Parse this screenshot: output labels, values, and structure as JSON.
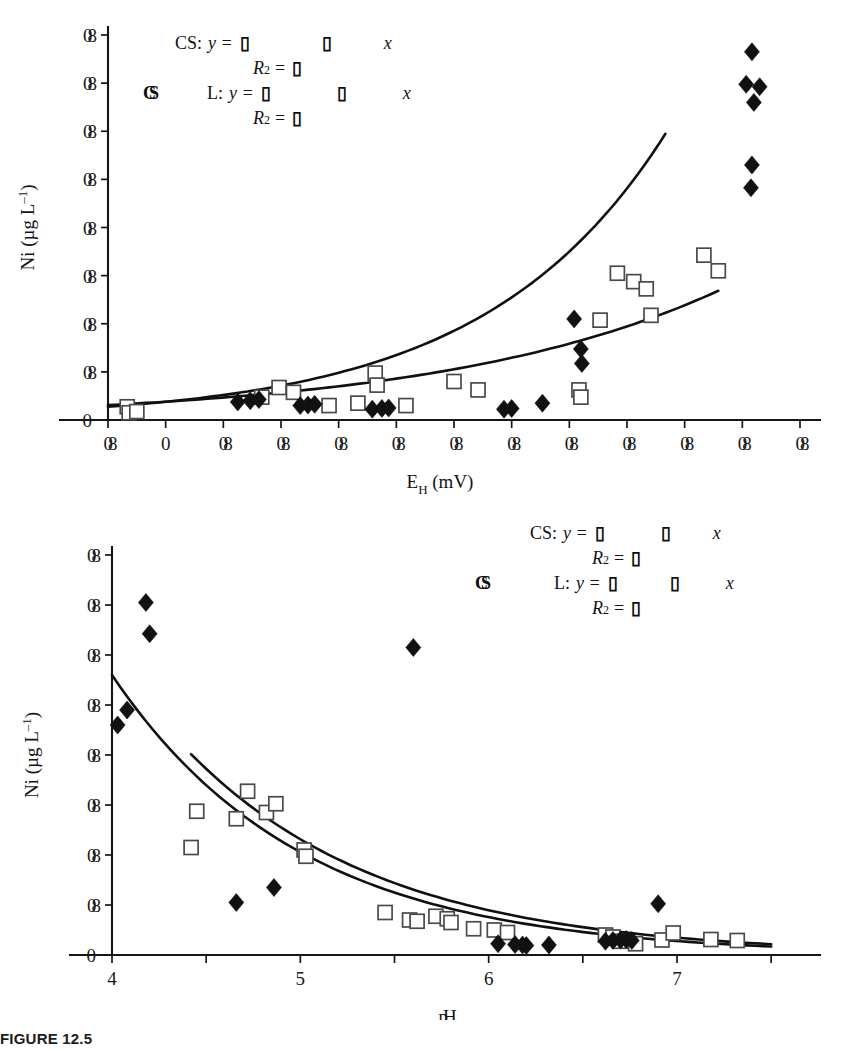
{
  "caption": {
    "text": "FIGURE 12.5"
  },
  "chart_data": [
    {
      "id": "eh-panel",
      "type": "scatter",
      "title": "",
      "xlabel": "E_H (mV)",
      "xlabel_parts": {
        "main": "E",
        "sub": "H",
        "unit": "(mV)"
      },
      "ylabel": "Ni (µg L⁻¹)",
      "ylabel_parts": {
        "main": "Ni",
        "unit": "(µg L",
        "exp": "–1",
        "close": ")"
      },
      "xlim": [
        -60,
        660
      ],
      "ylim": [
        0,
        16
      ],
      "xticks": [
        -60,
        0,
        60,
        120,
        180,
        240,
        300,
        360,
        420,
        480,
        540,
        600,
        660
      ],
      "xtick_labels": [
        "▯",
        "0",
        "▯",
        "▯",
        "▯",
        "▯",
        "▯",
        "▯",
        "▯",
        "▯",
        "▯",
        "▯",
        "▯"
      ],
      "xtick_labels_legible": [
        false,
        true,
        false,
        false,
        false,
        false,
        false,
        false,
        false,
        false,
        false,
        false,
        false
      ],
      "yticks": [
        0,
        2,
        4,
        6,
        8,
        10,
        12,
        14,
        16
      ],
      "ytick_labels": [
        "0",
        "▯",
        "▯",
        "▯",
        "▯",
        "▯",
        "▯",
        "▯",
        "▯"
      ],
      "ytick_labels_legible": [
        true,
        false,
        false,
        false,
        false,
        false,
        false,
        false,
        false
      ],
      "grid": false,
      "legend_position": "top-left",
      "series": [
        {
          "name": "L",
          "marker": "open-square",
          "points": [
            [
              -40,
              0.55
            ],
            [
              -38,
              0.3
            ],
            [
              -30,
              0.35
            ],
            [
              100,
              0.95
            ],
            [
              118,
              1.35
            ],
            [
              133,
              1.15
            ],
            [
              170,
              0.6
            ],
            [
              200,
              0.7
            ],
            [
              218,
              1.95
            ],
            [
              220,
              1.45
            ],
            [
              250,
              0.6
            ],
            [
              300,
              1.6
            ],
            [
              325,
              1.25
            ],
            [
              430,
              1.25
            ],
            [
              432,
              0.95
            ],
            [
              452,
              4.15
            ],
            [
              470,
              6.1
            ],
            [
              487,
              5.75
            ],
            [
              500,
              5.45
            ],
            [
              505,
              4.35
            ],
            [
              560,
              6.85
            ],
            [
              575,
              6.2
            ]
          ]
        },
        {
          "name": "CS",
          "marker": "filled-diamond",
          "points": [
            [
              75,
              0.75
            ],
            [
              88,
              0.8
            ],
            [
              97,
              0.85
            ],
            [
              140,
              0.6
            ],
            [
              148,
              0.62
            ],
            [
              155,
              0.65
            ],
            [
              215,
              0.45
            ],
            [
              225,
              0.48
            ],
            [
              232,
              0.5
            ],
            [
              352,
              0.45
            ],
            [
              360,
              0.48
            ],
            [
              392,
              0.7
            ],
            [
              425,
              4.2
            ],
            [
              432,
              2.95
            ],
            [
              433,
              2.35
            ],
            [
              610,
              15.3
            ],
            [
              604,
              13.95
            ],
            [
              618,
              13.85
            ],
            [
              612,
              13.2
            ],
            [
              610,
              10.6
            ],
            [
              609,
              9.65
            ]
          ]
        }
      ],
      "curves": [
        {
          "name": "CS-exponential",
          "kind": "exponential-rising"
        },
        {
          "name": "L-exponential",
          "kind": "exponential-rising-shallow"
        }
      ],
      "legend": {
        "cs_label": "CS:",
        "l_label": "L:",
        "cs_marker": "◆",
        "l_marker": "□",
        "cs_eq_prefix": "y =",
        "cs_eq_coef": "▯",
        "cs_eq_mid": "▯",
        "cs_eq_var": "x",
        "cs_r2_label": "R",
        "cs_r2_sup": "2",
        "cs_r2_eq": "=",
        "cs_r2_value": "▯",
        "l_eq_prefix": "y =",
        "l_eq_coef": "▯",
        "l_eq_mid": "▯",
        "l_eq_var": "x",
        "l_r2_label": "R",
        "l_r2_sup": "2",
        "l_r2_eq": "=",
        "l_r2_value": "▯",
        "series_tag_cs": "CS"
      }
    },
    {
      "id": "ph-panel",
      "type": "scatter",
      "title": "",
      "xlabel": "pH",
      "xlabel_parts": {
        "main": "pH"
      },
      "ylabel": "Ni (µg L⁻¹)",
      "ylabel_parts": {
        "main": "Ni",
        "unit": "(µg L",
        "exp": "–1",
        "close": ")"
      },
      "xlim": [
        4,
        7.6
      ],
      "ylim": [
        0,
        16
      ],
      "xticks": [
        4,
        4.5,
        5,
        5.5,
        6,
        6.5,
        7,
        7.5
      ],
      "xtick_labels": [
        "4",
        "",
        "5",
        "",
        "6",
        "",
        "7",
        ""
      ],
      "xtick_labels_legible": [
        true,
        true,
        true,
        true,
        true,
        true,
        true,
        true
      ],
      "yticks": [
        0,
        2,
        4,
        6,
        8,
        10,
        12,
        14,
        16
      ],
      "ytick_labels": [
        "0",
        "▯",
        "▯",
        "▯",
        "▯",
        "▯",
        "▯",
        "▯",
        "▯"
      ],
      "ytick_labels_legible": [
        true,
        false,
        false,
        false,
        false,
        false,
        false,
        false,
        false
      ],
      "grid": false,
      "legend_position": "top-right",
      "series": [
        {
          "name": "L",
          "marker": "open-square",
          "points": [
            [
              4.45,
              5.75
            ],
            [
              4.42,
              4.3
            ],
            [
              4.72,
              6.55
            ],
            [
              4.66,
              5.45
            ],
            [
              4.82,
              5.7
            ],
            [
              4.87,
              6.05
            ],
            [
              5.02,
              4.2
            ],
            [
              5.03,
              3.95
            ],
            [
              5.45,
              1.7
            ],
            [
              5.58,
              1.4
            ],
            [
              5.62,
              1.35
            ],
            [
              5.72,
              1.55
            ],
            [
              5.78,
              1.45
            ],
            [
              5.8,
              1.3
            ],
            [
              5.92,
              1.05
            ],
            [
              6.03,
              1.0
            ],
            [
              6.1,
              0.9
            ],
            [
              6.62,
              0.8
            ],
            [
              6.66,
              0.72
            ],
            [
              6.7,
              0.55
            ],
            [
              6.78,
              0.45
            ],
            [
              6.92,
              0.6
            ],
            [
              6.98,
              0.88
            ],
            [
              7.18,
              0.62
            ],
            [
              7.32,
              0.58
            ]
          ]
        },
        {
          "name": "CS",
          "marker": "filled-diamond",
          "points": [
            [
              4.18,
              14.1
            ],
            [
              4.2,
              12.85
            ],
            [
              4.08,
              9.8
            ],
            [
              4.03,
              9.2
            ],
            [
              5.6,
              12.3
            ],
            [
              4.66,
              2.1
            ],
            [
              4.86,
              2.7
            ],
            [
              6.05,
              0.45
            ],
            [
              6.14,
              0.42
            ],
            [
              6.18,
              0.4
            ],
            [
              6.2,
              0.38
            ],
            [
              6.32,
              0.4
            ],
            [
              6.62,
              0.55
            ],
            [
              6.66,
              0.58
            ],
            [
              6.7,
              0.6
            ],
            [
              6.73,
              0.62
            ],
            [
              6.76,
              0.58
            ],
            [
              6.9,
              2.05
            ]
          ]
        }
      ],
      "curves": [
        {
          "name": "CS-exponential-decay",
          "kind": "exponential-decay"
        },
        {
          "name": "L-exponential-decay",
          "kind": "exponential-decay-short"
        }
      ],
      "legend": {
        "cs_label": "CS:",
        "l_label": "L:",
        "cs_marker": "◆",
        "l_marker": "□",
        "cs_eq_prefix": "y =",
        "cs_eq_coef": "▯",
        "cs_eq_mid": "▯",
        "cs_eq_var": "x",
        "cs_r2_label": "R",
        "cs_r2_sup": "2",
        "cs_r2_eq": "=",
        "cs_r2_value": "▯",
        "l_eq_prefix": "y =",
        "l_eq_coef": "▯",
        "l_eq_mid": "▯",
        "l_eq_var": "x",
        "l_r2_label": "R",
        "l_r2_sup": "2",
        "l_r2_eq": "=",
        "l_r2_value": "▯",
        "series_tag_cs": "CS"
      }
    }
  ]
}
